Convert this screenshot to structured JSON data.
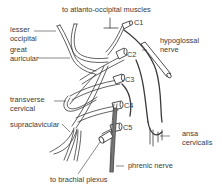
{
  "diagram": {
    "labels": {
      "top": "to atlanto-occipital muscles",
      "lesser_occipital": [
        "lesser",
        "occipital"
      ],
      "great_auricular": [
        "great",
        "auricular"
      ],
      "hypoglossal": [
        "hypoglossal",
        "nerve"
      ],
      "transverse_cervical": [
        "transverse",
        "cervical"
      ],
      "supraclavicular": "supraclavicular",
      "ansa_cervicalis": [
        "ansa",
        "cervicalis"
      ],
      "phrenic": "phrenic nerve",
      "brachial": "to brachial plexus"
    },
    "roots": [
      "C1",
      "C2",
      "C3",
      "C4",
      "C5"
    ],
    "colors": {
      "line": "#3a3a3a",
      "background": "#ffffff"
    }
  }
}
